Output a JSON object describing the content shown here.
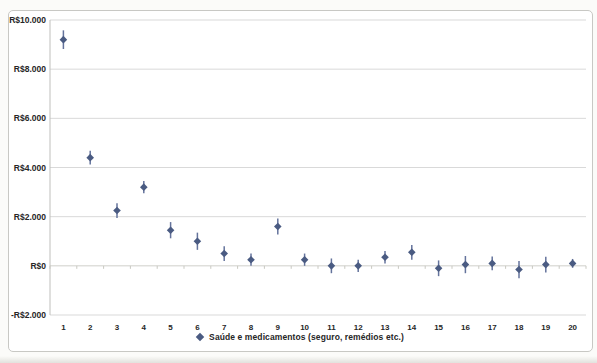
{
  "chart_data": {
    "type": "scatter",
    "title": "",
    "categories": [
      "1",
      "2",
      "3",
      "4",
      "5",
      "6",
      "7",
      "8",
      "9",
      "10",
      "11",
      "12",
      "13",
      "14",
      "15",
      "16",
      "17",
      "18",
      "19",
      "20"
    ],
    "series": [
      {
        "name": "Saúde e medicamentos (seguro, remédios etc.)",
        "marker": "diamond",
        "values": [
          9200,
          4400,
          2250,
          3200,
          1450,
          1000,
          500,
          250,
          1600,
          250,
          0,
          0,
          350,
          550,
          -100,
          50,
          100,
          -150,
          50,
          100
        ],
        "errors": [
          380,
          280,
          300,
          250,
          330,
          350,
          300,
          250,
          330,
          250,
          300,
          250,
          250,
          300,
          320,
          350,
          280,
          350,
          320,
          180
        ]
      }
    ],
    "ylim": [
      -2000,
      10000
    ],
    "ytick_interval": 2000,
    "yticks": [
      {
        "label": "R$10.000",
        "value": 10000
      },
      {
        "label": "R$8.000",
        "value": 8000
      },
      {
        "label": "R$6.000",
        "value": 6000
      },
      {
        "label": "R$4.000",
        "value": 4000
      },
      {
        "label": "R$2.000",
        "value": 2000
      },
      {
        "label": "R$0",
        "value": 0
      },
      {
        "label": "-R$2.000",
        "value": -2000
      }
    ],
    "grid": true,
    "legend_position": "bottom"
  },
  "colors": {
    "marker": "#4a5b82",
    "error_bar": "#64739c",
    "gridline": "#d9d9d9",
    "zero_axis": "#cfcfca",
    "axis_line": "#bfbfbc",
    "tick": "#c9c9c2",
    "text": "#262626"
  }
}
